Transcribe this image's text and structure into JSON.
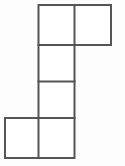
{
  "figure": {
    "name": "hexomino-outline",
    "shape_type": "hexomino",
    "cell_count": 6,
    "background_color": "#fdfdfd",
    "cell_fill_color": "#ffffff",
    "line_color": "#555555",
    "line_width": 2,
    "grid": {
      "cell_width": 36.5,
      "cell_height": 37.5,
      "origin_x": 5,
      "origin_y": 5,
      "columns": 3,
      "rows": 4,
      "column_edges": [
        5,
        38.5,
        74.5,
        111
      ],
      "row_edges": [
        5,
        45,
        81.5,
        118,
        158
      ]
    },
    "cells": [
      {
        "name": "cell-r0c1",
        "row": 0,
        "col": 1,
        "x": 38.5,
        "y": 5,
        "w": 36,
        "h": 40
      },
      {
        "name": "cell-r0c2",
        "row": 0,
        "col": 2,
        "x": 74.5,
        "y": 5,
        "w": 36.5,
        "h": 40
      },
      {
        "name": "cell-r1c1",
        "row": 1,
        "col": 1,
        "x": 38.5,
        "y": 45,
        "w": 36,
        "h": 36.5
      },
      {
        "name": "cell-r2c1",
        "row": 2,
        "col": 1,
        "x": 38.5,
        "y": 81.5,
        "w": 36,
        "h": 36.5
      },
      {
        "name": "cell-r3c0",
        "row": 3,
        "col": 0,
        "x": 5,
        "y": 118,
        "w": 33.5,
        "h": 40
      },
      {
        "name": "cell-r3c1",
        "row": 3,
        "col": 1,
        "x": 38.5,
        "y": 118,
        "w": 36,
        "h": 40
      }
    ],
    "outline_path": "M 38.5 5 L 111 5 L 111 45 L 74.5 45 L 74.5 118 L 74.5 158 L 5 158 L 5 118 L 38.5 118 L 38.5 45 Z",
    "interior_segments": [
      {
        "name": "divider-vertical-top-row",
        "x1": 74.5,
        "y1": 5,
        "x2": 74.5,
        "y2": 45
      },
      {
        "name": "divider-horizontal-row0-row1",
        "x1": 38.5,
        "y1": 45,
        "x2": 74.5,
        "y2": 45
      },
      {
        "name": "divider-horizontal-row1-row2",
        "x1": 38.5,
        "y1": 81.5,
        "x2": 74.5,
        "y2": 81.5
      },
      {
        "name": "divider-horizontal-row2-row3",
        "x1": 5,
        "y1": 118,
        "x2": 74.5,
        "y2": 118
      },
      {
        "name": "divider-vertical-bottom-row",
        "x1": 38.5,
        "y1": 118,
        "x2": 38.5,
        "y2": 158
      }
    ]
  }
}
